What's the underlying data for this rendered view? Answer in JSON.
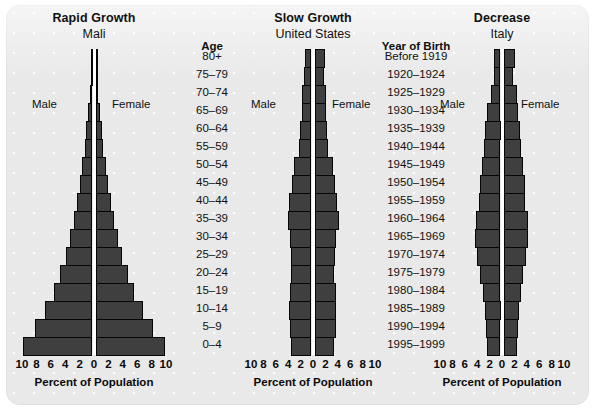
{
  "figure": {
    "background_color": "#e9e9e9",
    "bar_color": "#3f3f3f",
    "bar_outline_color": "#050505",
    "axis_line_color": "#ffffff"
  },
  "axis": {
    "title": "Percent of Population",
    "ticks": [
      "10",
      "8",
      "6",
      "4",
      "2",
      "0",
      "2",
      "4",
      "6",
      "8",
      "10"
    ],
    "max": 10
  },
  "labels": {
    "male": "Male",
    "female": "Female"
  },
  "age_column": {
    "header": "Age",
    "items": [
      "80+",
      "75–79",
      "70–74",
      "65–69",
      "60–64",
      "55–59",
      "50–54",
      "45–49",
      "40–44",
      "35–39",
      "30–34",
      "25–29",
      "20–24",
      "15–19",
      "10–14",
      "5–9",
      "0–4"
    ]
  },
  "year_column": {
    "header": "Year of Birth",
    "items": [
      "Before 1919",
      "1920–1924",
      "1925–1929",
      "1930–1934",
      "1935–1939",
      "1940–1944",
      "1945–1949",
      "1950–1954",
      "1955–1959",
      "1960–1964",
      "1965–1969",
      "1970–1974",
      "1975–1979",
      "1980–1984",
      "1985–1989",
      "1990–1994",
      "1995–1999"
    ]
  },
  "chart_data": [
    {
      "type": "bar",
      "title": "Rapid Growth",
      "subtitle": "Mali",
      "xlabel": "Percent of Population",
      "ylabel": "Age",
      "xlim": [
        -10,
        10
      ],
      "grid": false,
      "legend": [
        "Male",
        "Female"
      ],
      "categories": [
        "80+",
        "75–79",
        "70–74",
        "65–69",
        "60–64",
        "55–59",
        "50–54",
        "45–49",
        "40–44",
        "35–39",
        "30–34",
        "25–29",
        "20–24",
        "15–19",
        "10–14",
        "5–9",
        "0–4"
      ],
      "series": [
        {
          "name": "Male",
          "values": [
            0.15,
            0.25,
            0.4,
            0.6,
            0.85,
            1.1,
            1.4,
            1.8,
            2.2,
            2.6,
            3.1,
            3.7,
            4.5,
            5.4,
            6.6,
            8.0,
            9.6
          ]
        },
        {
          "name": "Female",
          "values": [
            0.15,
            0.25,
            0.4,
            0.6,
            0.85,
            1.1,
            1.4,
            1.8,
            2.2,
            2.6,
            3.1,
            3.7,
            4.5,
            5.4,
            6.6,
            8.0,
            9.6
          ]
        }
      ]
    },
    {
      "type": "bar",
      "title": "Slow Growth",
      "subtitle": "United States",
      "xlabel": "Percent of Population",
      "ylabel": "Age",
      "xlim": [
        -10,
        10
      ],
      "grid": false,
      "legend": [
        "Male",
        "Female"
      ],
      "categories": [
        "80+",
        "75–79",
        "70–74",
        "65–69",
        "60–64",
        "55–59",
        "50–54",
        "45–49",
        "40–44",
        "35–39",
        "30–34",
        "25–29",
        "20–24",
        "15–19",
        "10–14",
        "5–9",
        "0–4"
      ],
      "series": [
        {
          "name": "Male",
          "values": [
            1.0,
            1.2,
            1.5,
            1.6,
            1.8,
            2.0,
            2.8,
            3.2,
            3.6,
            3.8,
            3.5,
            3.3,
            3.3,
            3.5,
            3.6,
            3.5,
            3.3
          ]
        },
        {
          "name": "Female",
          "values": [
            1.7,
            1.5,
            1.8,
            1.8,
            2.0,
            2.2,
            3.0,
            3.3,
            3.7,
            3.9,
            3.5,
            3.3,
            3.2,
            3.4,
            3.5,
            3.4,
            3.2
          ]
        }
      ]
    },
    {
      "type": "bar",
      "title": "Decrease",
      "subtitle": "Italy",
      "xlabel": "Percent of Population",
      "ylabel": "Age",
      "xlim": [
        -10,
        10
      ],
      "grid": false,
      "legend": [
        "Male",
        "Female"
      ],
      "categories": [
        "80+",
        "75–79",
        "70–74",
        "65–69",
        "60–64",
        "55–59",
        "50–54",
        "45–49",
        "40–44",
        "35–39",
        "30–34",
        "25–29",
        "20–24",
        "15–19",
        "10–14",
        "5–9",
        "0–4"
      ],
      "series": [
        {
          "name": "Male",
          "values": [
            1.0,
            1.1,
            1.6,
            2.2,
            2.5,
            2.7,
            3.0,
            3.3,
            3.4,
            3.9,
            4.1,
            3.8,
            3.3,
            2.9,
            2.5,
            2.3,
            2.2
          ]
        },
        {
          "name": "Female",
          "values": [
            1.9,
            1.6,
            2.1,
            2.4,
            2.6,
            2.8,
            3.1,
            3.4,
            3.5,
            3.9,
            4.0,
            3.7,
            3.2,
            2.8,
            2.5,
            2.3,
            2.2
          ]
        }
      ]
    }
  ]
}
